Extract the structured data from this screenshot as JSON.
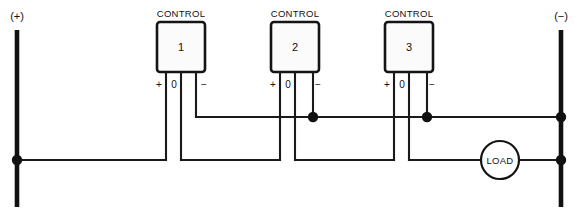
{
  "diagram": {
    "colors": {
      "line": "#111111",
      "background": "#ffffff",
      "box_fill": "#fbfbfb"
    },
    "supply": {
      "positive_label": "(+)",
      "negative_label": "(−)"
    },
    "terminal_labels": {
      "plus": "+",
      "zero": "0",
      "minus": "−"
    },
    "controls": [
      {
        "caption": "CONTROL",
        "number": "1",
        "terminals": [
          "+",
          "0",
          "−"
        ]
      },
      {
        "caption": "CONTROL",
        "number": "2",
        "terminals": [
          "+",
          "0",
          "−"
        ]
      },
      {
        "caption": "CONTROL",
        "number": "3",
        "terminals": [
          "+",
          "0",
          "−"
        ]
      }
    ],
    "load": {
      "label": "LOAD"
    }
  }
}
